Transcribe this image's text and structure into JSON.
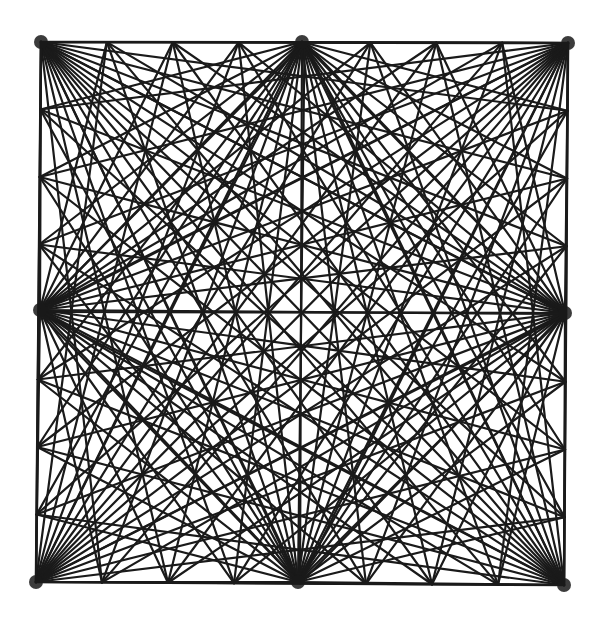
{
  "diagram": {
    "type": "string-art-square",
    "stroke_color": "#1a1a1a",
    "background_color": "#ffffff",
    "stroke_width": 2.2,
    "subdivisions_per_edge": 16,
    "square": {
      "top_left": [
        41,
        42
      ],
      "top_right": [
        568,
        43
      ],
      "bottom_right": [
        564,
        585
      ],
      "bottom_left": [
        36,
        582
      ]
    },
    "hubs": [
      {
        "name": "top-left",
        "pos": [
          41,
          42
        ]
      },
      {
        "name": "top-mid",
        "pos": [
          302,
          42
        ]
      },
      {
        "name": "top-right",
        "pos": [
          568,
          43
        ]
      },
      {
        "name": "right-mid",
        "pos": [
          565,
          313
        ]
      },
      {
        "name": "bottom-right",
        "pos": [
          564,
          585
        ]
      },
      {
        "name": "bottom-mid",
        "pos": [
          298,
          582
        ]
      },
      {
        "name": "bottom-left",
        "pos": [
          36,
          582
        ]
      },
      {
        "name": "left-mid",
        "pos": [
          40,
          310
        ]
      }
    ]
  }
}
